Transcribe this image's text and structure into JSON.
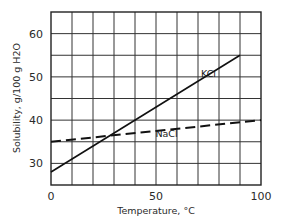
{
  "chart_data": {
    "type": "line",
    "title": "",
    "xlabel": "Temperature, °C",
    "ylabel": "Solubility, g/100 g H2O",
    "xlim": [
      0,
      100
    ],
    "ylim": [
      25,
      65
    ],
    "x_ticks": [
      0,
      50,
      100
    ],
    "y_ticks": [
      30,
      40,
      50,
      60
    ],
    "grid": true,
    "grid_x_step": 10,
    "grid_y_step": 5,
    "legend": "inline labels",
    "series": [
      {
        "name": "KCl",
        "style": "solid",
        "x": [
          0,
          90
        ],
        "y": [
          28,
          55
        ],
        "label_pos": [
          75,
          50
        ]
      },
      {
        "name": "NaCl",
        "style": "dashed",
        "x": [
          0,
          100
        ],
        "y": [
          35,
          40
        ],
        "label_pos": [
          55,
          36
        ]
      }
    ]
  }
}
